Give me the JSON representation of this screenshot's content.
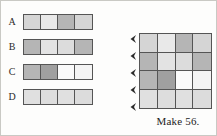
{
  "background_color": "#fdfdfc",
  "border_color": "#555555",
  "palette": {
    "white": "#fdfdfd",
    "near_white": "#f3f3f3",
    "light": "#e3e3e3",
    "light_medium": "#d5d5d5",
    "medium": "#bdbdbd",
    "medium_dark": "#a8a8a8",
    "dark": "#999999"
  },
  "strips": {
    "rows": [
      {
        "label": "A",
        "cells": [
          "#d5d5d5",
          "#e9e9e9",
          "#b5b5b5",
          "#d5d5d5"
        ]
      },
      {
        "label": "B",
        "cells": [
          "#b5b5b5",
          "#e3e3e3",
          "#dcdcdc",
          "#b5b5b5"
        ]
      },
      {
        "label": "C",
        "cells": [
          "#b5b5b5",
          "#a0a0a0",
          "#fafafa",
          "#f4f4f4"
        ]
      },
      {
        "label": "D",
        "cells": [
          "#e0e0e0",
          "#dddddd",
          "#e0e0e0",
          "#dcdcdc"
        ]
      }
    ]
  },
  "grid": {
    "rows": 4,
    "cols": 4,
    "cells": [
      [
        "#d5d5d5",
        "#e9e9e9",
        "#b5b5b5",
        "#d5d5d5"
      ],
      [
        "#b5b5b5",
        "#e3e3e3",
        "#dcdcdc",
        "#b5b5b5"
      ],
      [
        "#b5b5b5",
        "#a0a0a0",
        "#fafafa",
        "#f4f4f4"
      ],
      [
        "#e0e0e0",
        "#dddddd",
        "#e0e0e0",
        "#dcdcdc"
      ]
    ],
    "arrow_count": 5,
    "arrow_icon": "left-chevron-arrow"
  },
  "caption": {
    "text": "Make 56."
  }
}
